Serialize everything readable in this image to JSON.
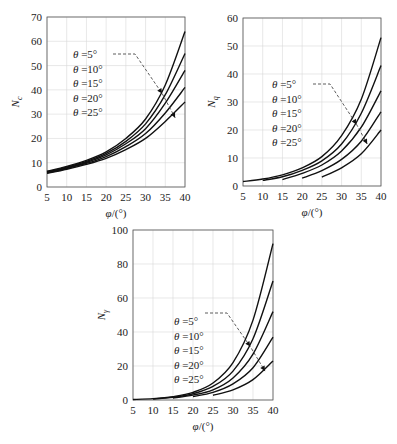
{
  "chart_data": [
    {
      "type": "line",
      "title": "",
      "ylabel": "Nc",
      "ylabel_main": "N",
      "ylabel_sub": "c",
      "xlabel": "φ/(°)",
      "xlim": [
        5,
        40
      ],
      "ylim": [
        0,
        70
      ],
      "xticks": [
        5,
        10,
        15,
        20,
        25,
        30,
        35,
        40
      ],
      "yticks": [
        0,
        10,
        20,
        30,
        40,
        50,
        60,
        70
      ],
      "grid": true,
      "legend": [
        "θ =5°",
        "θ =10°",
        "θ =15°",
        "θ =20°",
        "θ =25°"
      ],
      "legend_position": "upper-left-center with dashed arrow to curves",
      "x": [
        5,
        10,
        15,
        20,
        25,
        30,
        35,
        40
      ],
      "series": [
        {
          "name": "θ=5°",
          "values": [
            6.5,
            8.5,
            11.0,
            14.5,
            20.0,
            28.0,
            42.0,
            64.0
          ]
        },
        {
          "name": "θ=10°",
          "values": [
            6.2,
            8.2,
            10.5,
            13.8,
            18.8,
            26.0,
            38.0,
            55.0
          ]
        },
        {
          "name": "θ=15°",
          "values": [
            6.0,
            7.9,
            10.1,
            13.2,
            17.8,
            24.0,
            34.5,
            48.0
          ]
        },
        {
          "name": "θ=20°",
          "values": [
            5.8,
            7.6,
            9.7,
            12.5,
            16.6,
            22.0,
            30.5,
            41.0
          ]
        },
        {
          "name": "θ=25°",
          "values": [
            5.6,
            7.3,
            9.3,
            11.8,
            15.4,
            20.0,
            27.0,
            35.0
          ]
        }
      ]
    },
    {
      "type": "line",
      "title": "",
      "ylabel": "Nq",
      "ylabel_main": "N",
      "ylabel_sub": "q",
      "xlabel": "φ/(°)",
      "xlim": [
        5,
        40
      ],
      "ylim": [
        0,
        60
      ],
      "xticks": [
        5,
        10,
        15,
        20,
        25,
        30,
        35,
        40
      ],
      "yticks": [
        0,
        10,
        20,
        30,
        40,
        50,
        60
      ],
      "grid": true,
      "legend": [
        "θ =5°",
        "θ =10°",
        "θ =15°",
        "θ =20°",
        "θ =25°"
      ],
      "legend_position": "center-left with dashed arrow to curves",
      "series": [
        {
          "name": "θ=5°",
          "x": [
            5,
            10,
            15,
            20,
            25,
            30,
            35,
            40
          ],
          "values": [
            1.6,
            2.5,
            4.0,
            6.5,
            10.5,
            18.0,
            31.0,
            53.0
          ]
        },
        {
          "name": "θ=10°",
          "x": [
            10,
            15,
            20,
            25,
            30,
            35,
            40
          ],
          "values": [
            2.0,
            3.3,
            5.6,
            9.0,
            15.0,
            26.0,
            43.0
          ]
        },
        {
          "name": "θ=15°",
          "x": [
            15,
            20,
            25,
            30,
            35,
            40
          ],
          "values": [
            2.3,
            4.5,
            7.5,
            12.5,
            21.0,
            34.0
          ]
        },
        {
          "name": "θ=20°",
          "x": [
            20,
            25,
            30,
            35,
            40
          ],
          "values": [
            2.8,
            5.5,
            9.5,
            16.0,
            26.5
          ]
        },
        {
          "name": "θ=25°",
          "x": [
            25,
            30,
            35,
            40
          ],
          "values": [
            3.2,
            6.5,
            11.5,
            20.0
          ]
        }
      ]
    },
    {
      "type": "line",
      "title": "",
      "ylabel": "Nγ",
      "ylabel_main": "N",
      "ylabel_sub": "γ",
      "xlabel": "φ/(°)",
      "xlim": [
        5,
        40
      ],
      "ylim": [
        0,
        100
      ],
      "xticks": [
        5,
        10,
        15,
        20,
        25,
        30,
        35,
        40
      ],
      "yticks": [
        0,
        20,
        40,
        60,
        80,
        100
      ],
      "grid": true,
      "legend": [
        "θ =5°",
        "θ =10°",
        "θ =15°",
        "θ =20°",
        "θ =25°"
      ],
      "legend_position": "center with dashed arrow to curves",
      "series": [
        {
          "name": "θ=5°",
          "x": [
            5,
            10,
            15,
            20,
            25,
            30,
            35,
            40
          ],
          "values": [
            0.3,
            0.8,
            2.0,
            4.5,
            10.0,
            22.0,
            47.0,
            92.0
          ]
        },
        {
          "name": "θ=10°",
          "x": [
            10,
            15,
            20,
            25,
            30,
            35,
            40
          ],
          "values": [
            0.6,
            1.6,
            3.7,
            8.0,
            17.0,
            36.0,
            70.0
          ]
        },
        {
          "name": "θ=15°",
          "x": [
            15,
            20,
            25,
            30,
            35,
            40
          ],
          "values": [
            1.2,
            2.9,
            6.0,
            13.0,
            27.0,
            52.0
          ]
        },
        {
          "name": "θ=20°",
          "x": [
            20,
            25,
            30,
            35,
            40
          ],
          "values": [
            2.0,
            4.5,
            9.5,
            19.0,
            37.0
          ]
        },
        {
          "name": "θ=25°",
          "x": [
            25,
            30,
            35,
            40
          ],
          "values": [
            2.8,
            6.0,
            12.0,
            23.0
          ]
        }
      ]
    }
  ],
  "panels": [
    {
      "box": {
        "left": 47,
        "top": 17,
        "right": 185,
        "bottom": 187
      },
      "legend_xy": [
        73,
        58
      ],
      "legend_step": 14.5,
      "dash_start": [
        113,
        54
      ],
      "dash_corner": [
        135,
        54
      ],
      "arrow_phi": [
        [
          34.2,
          38.5
        ],
        [
          37.5,
          28.5
        ]
      ]
    },
    {
      "box": {
        "left": 243,
        "top": 18,
        "right": 381,
        "bottom": 186
      },
      "legend_xy": [
        272,
        88
      ],
      "legend_step": 14.5,
      "dash_start": [
        313,
        84
      ],
      "dash_corner": [
        330,
        84
      ],
      "arrow_phi": [
        [
          33.8,
          22.0
        ],
        [
          36.5,
          15.0
        ]
      ]
    },
    {
      "box": {
        "left": 133,
        "top": 230,
        "right": 273,
        "bottom": 400
      },
      "legend_xy": [
        174,
        325
      ],
      "legend_step": 14.5,
      "dash_start": [
        205,
        313
      ],
      "dash_corner": [
        227,
        313
      ],
      "arrow_phi": [
        [
          34.3,
          31.5
        ],
        [
          38.0,
          17.0
        ]
      ]
    }
  ]
}
